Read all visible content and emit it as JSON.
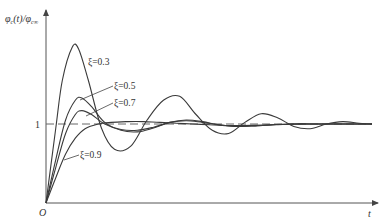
{
  "chart_data": {
    "type": "line",
    "title": "",
    "xlabel": "t",
    "ylabel": "φc(t)/φc∞",
    "ylabel_parts": {
      "main": "φ",
      "sub1": "c",
      "mid": "(t)/φ",
      "sub2": "c∞"
    },
    "origin_label": "O",
    "reference_line": {
      "y": 1,
      "label": "1",
      "style": "dashed"
    },
    "grid": false,
    "legend_position": "inline leader-line labels",
    "xlim": [
      0,
      10
    ],
    "ylim": [
      0,
      2.4
    ],
    "series": [
      {
        "name": "ξ=0.3",
        "label": "ξ=0.3",
        "x": [
          0,
          0.3,
          0.5,
          0.8,
          1.0,
          1.3,
          1.7,
          2.1,
          2.6,
          3.1,
          3.6,
          4.1,
          4.6,
          5.1,
          5.6,
          6.1,
          6.6,
          7.1,
          7.6,
          8.1,
          8.6,
          9.1,
          9.6,
          10.0
        ],
        "values": [
          0,
          0.95,
          1.55,
          1.97,
          1.95,
          1.55,
          0.95,
          0.68,
          0.72,
          1.05,
          1.3,
          1.35,
          1.12,
          0.92,
          0.88,
          1.02,
          1.13,
          1.08,
          0.97,
          0.94,
          1.0,
          1.03,
          1.01,
          1.0
        ]
      },
      {
        "name": "ξ=0.5",
        "label": "ξ=0.5",
        "x": [
          0,
          0.3,
          0.6,
          0.9,
          1.1,
          1.4,
          1.8,
          2.3,
          2.8,
          3.3,
          3.8,
          4.3,
          4.8,
          5.3,
          5.8,
          6.5,
          7.5,
          8.5,
          10.0
        ],
        "values": [
          0,
          0.55,
          1.05,
          1.3,
          1.33,
          1.22,
          1.02,
          0.92,
          0.9,
          0.95,
          1.02,
          1.05,
          1.03,
          0.99,
          0.97,
          0.98,
          1.0,
          1.0,
          1.0
        ]
      },
      {
        "name": "ξ=0.7",
        "label": "ξ=0.7",
        "x": [
          0,
          0.3,
          0.6,
          0.9,
          1.1,
          1.4,
          1.8,
          2.3,
          2.8,
          3.3,
          3.8,
          4.3,
          4.8,
          5.3,
          5.8,
          6.5,
          7.5,
          8.5,
          10.0
        ],
        "values": [
          0,
          0.45,
          0.88,
          1.12,
          1.17,
          1.12,
          1.0,
          0.93,
          0.92,
          0.96,
          1.02,
          1.04,
          1.02,
          0.99,
          0.97,
          0.98,
          1.0,
          1.0,
          1.0
        ]
      },
      {
        "name": "ξ=0.9",
        "label": "ξ=0.9",
        "x": [
          0,
          0.3,
          0.6,
          0.9,
          1.2,
          1.6,
          2.0,
          2.5,
          3.0,
          3.5,
          4.0,
          4.5,
          5.0,
          5.5,
          6.0,
          7.0,
          8.0,
          10.0
        ],
        "values": [
          0,
          0.32,
          0.62,
          0.82,
          0.94,
          1.0,
          1.02,
          1.03,
          1.03,
          1.02,
          1.01,
          1.0,
          0.99,
          0.98,
          0.98,
          0.99,
          1.0,
          1.0
        ]
      }
    ]
  },
  "colors": {
    "curve": "#3a3a3a",
    "axis": "#555555",
    "dash": "#666666",
    "text": "#333333"
  }
}
